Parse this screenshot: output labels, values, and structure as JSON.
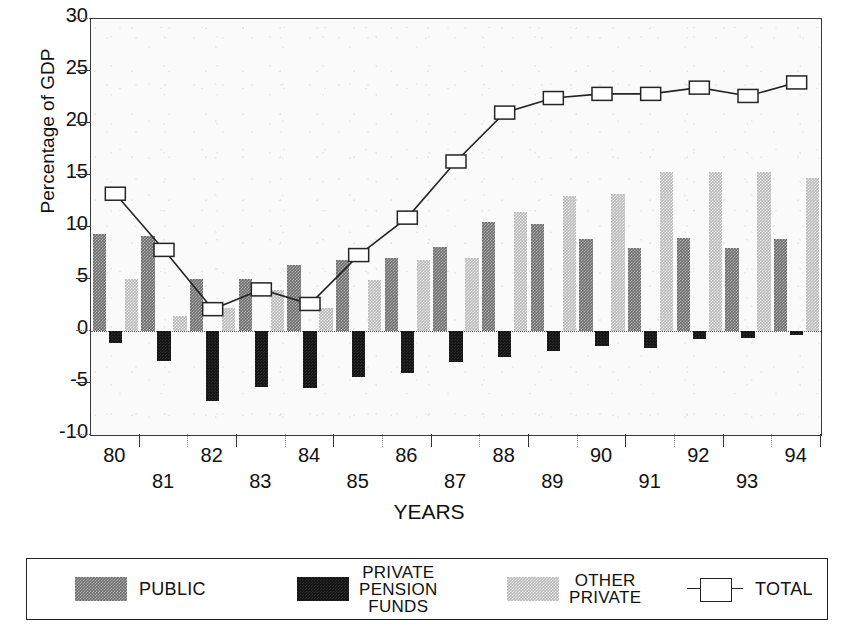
{
  "axes": {
    "ylabel": "Percentage of GDP",
    "xlabel": "YEARS",
    "yticks": [
      "30",
      "25",
      "20",
      "15",
      "10",
      "5",
      "0",
      "-5",
      "-10"
    ],
    "xticks": [
      "80",
      "81",
      "82",
      "83",
      "84",
      "85",
      "86",
      "87",
      "88",
      "89",
      "90",
      "91",
      "92",
      "93",
      "94"
    ]
  },
  "legend": {
    "public": "PUBLIC",
    "pension_line1": "PRIVATE",
    "pension_line2": "PENSION",
    "pension_line3": "FUNDS",
    "other_line1": "OTHER",
    "other_line2": "PRIVATE",
    "total": "TOTAL"
  },
  "colors": {
    "public": "#6e6e6e",
    "pension": "#161616",
    "other": "#b9b9b9",
    "total": "#242424",
    "frame": "#3a3a3a",
    "background": "#fafafa"
  },
  "chart_data": {
    "type": "bar",
    "title": "",
    "xlabel": "YEARS",
    "ylabel": "Percentage of GDP",
    "ylim": [
      -10,
      30
    ],
    "ytick_step": 5,
    "grid": false,
    "legend_position": "bottom",
    "categories": [
      "80",
      "81",
      "82",
      "83",
      "84",
      "85",
      "86",
      "87",
      "88",
      "89",
      "90",
      "91",
      "92",
      "93",
      "94"
    ],
    "series": [
      {
        "name": "PUBLIC",
        "type": "bar",
        "color": "#6e6e6e",
        "values": [
          9.3,
          9.1,
          5.0,
          5.0,
          6.3,
          6.8,
          7.0,
          8.1,
          10.5,
          10.3,
          8.8,
          8.0,
          8.9,
          8.0,
          8.8
        ]
      },
      {
        "name": "PRIVATE PENSION FUNDS",
        "type": "bar",
        "color": "#161616",
        "values": [
          -1.2,
          -2.9,
          -6.7,
          -5.4,
          -5.5,
          -4.4,
          -4.0,
          -3.0,
          -2.5,
          -1.9,
          -1.4,
          -1.6,
          -0.8,
          -0.7,
          -0.4
        ]
      },
      {
        "name": "OTHER PRIVATE",
        "type": "bar",
        "color": "#b9b9b9",
        "values": [
          5.0,
          1.4,
          2.2,
          3.9,
          2.2,
          4.9,
          6.8,
          7.0,
          11.4,
          13.0,
          13.2,
          15.3,
          15.3,
          15.3,
          14.7
        ]
      },
      {
        "name": "TOTAL",
        "type": "line",
        "marker": "square",
        "color": "#242424",
        "values": [
          13.2,
          7.8,
          2.1,
          4.0,
          2.6,
          7.3,
          10.9,
          16.3,
          21.0,
          22.4,
          22.8,
          22.8,
          23.4,
          22.6,
          23.9
        ]
      }
    ]
  }
}
